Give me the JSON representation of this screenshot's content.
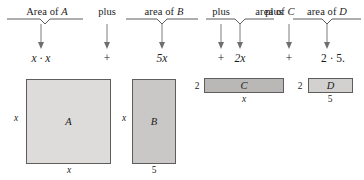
{
  "figure": {
    "title_row": {
      "terms": [
        {
          "prefix": "Area of ",
          "variable": "A"
        },
        {
          "prefix": "area of ",
          "variable": "B"
        },
        {
          "prefix": "area of ",
          "variable": "C"
        },
        {
          "prefix": "area of ",
          "variable": "D"
        }
      ],
      "connectors": [
        "plus",
        "plus",
        "plus"
      ]
    },
    "expression_row": {
      "terms": [
        "x · x",
        "5x",
        "2x",
        "2 · 5."
      ],
      "operators": [
        "+",
        "+",
        "+"
      ]
    },
    "shapes": [
      {
        "label": "A",
        "side_label": "x",
        "bottom_label": "x",
        "left_label": "",
        "fill": "#dddcda"
      },
      {
        "label": "B",
        "side_label": "x",
        "bottom_label": "5",
        "left_label": "",
        "fill": "#c9c8c6"
      },
      {
        "label": "C",
        "side_label": "",
        "bottom_label": "x",
        "left_label": "2",
        "fill": "#b9b8b6"
      },
      {
        "label": "D",
        "side_label": "",
        "bottom_label": "5",
        "left_label": "2",
        "fill": "#d2d1cf"
      }
    ]
  },
  "colors": {
    "stroke": "#5d5d5d",
    "arrow": "#6e6e6e",
    "brace": "#4a4a4a",
    "text": "#1b1b1b",
    "background": "#ffffff"
  }
}
